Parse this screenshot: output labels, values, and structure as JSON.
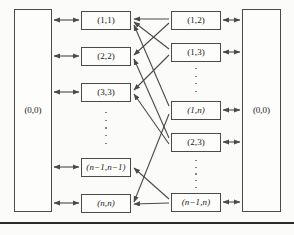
{
  "figure": {
    "background_color": "#fbfbfa",
    "line_color": "#4a4a4a",
    "text_color": "#1a1a1a",
    "bottom_rule_color": "#2b2b2b"
  },
  "left_panel": {
    "label": "(0,0)",
    "x": 14,
    "y": 9,
    "width": 38,
    "height": 203
  },
  "right_panel": {
    "label": "(0,0)",
    "x": 242,
    "y": 9,
    "width": 39,
    "height": 203
  },
  "left_column": {
    "nodes": [
      {
        "label": "(1,1)",
        "x": 81,
        "y": 11,
        "width": 50,
        "height": 19
      },
      {
        "label": "(2,2)",
        "x": 81,
        "y": 47,
        "width": 50,
        "height": 19
      },
      {
        "label": "(3,3)",
        "x": 81,
        "y": 83,
        "width": 50,
        "height": 19
      },
      {
        "label": "(n−1,n−1)",
        "x": 81,
        "y": 158,
        "width": 50,
        "height": 19
      },
      {
        "label": "(n,n)",
        "x": 81,
        "y": 194,
        "width": 50,
        "height": 19
      }
    ],
    "ellipsis": {
      "x": 106,
      "y": 112,
      "dots": 5
    }
  },
  "right_column": {
    "nodes": [
      {
        "label": "(1,2)",
        "x": 171,
        "y": 11,
        "width": 50,
        "height": 19
      },
      {
        "label": "(1,3)",
        "x": 171,
        "y": 43,
        "width": 50,
        "height": 19
      },
      {
        "label": "(1,n)",
        "x": 171,
        "y": 101,
        "width": 50,
        "height": 19
      },
      {
        "label": "(2,3)",
        "x": 171,
        "y": 133,
        "width": 50,
        "height": 19
      },
      {
        "label": "(n−1,n)",
        "x": 171,
        "y": 193,
        "width": 50,
        "height": 19
      }
    ],
    "ellipses": [
      {
        "x": 196,
        "y": 70,
        "dots": 4
      },
      {
        "x": 196,
        "y": 161,
        "dots": 5
      }
    ]
  },
  "connectors": {
    "left_panel_double_arrows": [
      {
        "from_x": 52,
        "to_x": 81,
        "y": 20
      },
      {
        "from_x": 52,
        "to_x": 81,
        "y": 56
      },
      {
        "from_x": 52,
        "to_x": 81,
        "y": 92
      },
      {
        "from_x": 52,
        "to_x": 81,
        "y": 167
      },
      {
        "from_x": 52,
        "to_x": 81,
        "y": 203
      }
    ],
    "right_panel_double_arrows": [
      {
        "from_x": 221,
        "to_x": 242,
        "y": 20
      },
      {
        "from_x": 221,
        "to_x": 242,
        "y": 52
      },
      {
        "from_x": 221,
        "to_x": 242,
        "y": 110
      },
      {
        "from_x": 221,
        "to_x": 242,
        "y": 142
      },
      {
        "from_x": 221,
        "to_x": 242,
        "y": 202
      }
    ],
    "cross_arrows": [
      {
        "from": "(1,2)",
        "to": "(1,1)",
        "x1": 171,
        "y1": 20,
        "x2": 133,
        "y2": 20
      },
      {
        "from": "(1,2)",
        "to": "(2,2)",
        "x1": 171,
        "y1": 22,
        "x2": 133,
        "y2": 56
      },
      {
        "from": "(1,3)",
        "to": "(1,1)",
        "x1": 171,
        "y1": 50,
        "x2": 133,
        "y2": 22
      },
      {
        "from": "(1,3)",
        "to": "(3,3)",
        "x1": 171,
        "y1": 54,
        "x2": 133,
        "y2": 90
      },
      {
        "from": "(1,n)",
        "to": "(1,1)",
        "x1": 171,
        "y1": 108,
        "x2": 133,
        "y2": 24
      },
      {
        "from": "(1,n)",
        "to": "(n,n)",
        "x1": 171,
        "y1": 112,
        "x2": 133,
        "y2": 203
      },
      {
        "from": "(2,3)",
        "to": "(2,2)",
        "x1": 171,
        "y1": 140,
        "x2": 133,
        "y2": 58
      },
      {
        "from": "(2,3)",
        "to": "(3,3)",
        "x1": 171,
        "y1": 143,
        "x2": 133,
        "y2": 92
      },
      {
        "from": "(n−1,n)",
        "to": "(n−1,n−1)",
        "x1": 171,
        "y1": 199,
        "x2": 133,
        "y2": 169
      },
      {
        "from": "(n−1,n)",
        "to": "(n,n)",
        "x1": 171,
        "y1": 203,
        "x2": 133,
        "y2": 205
      }
    ]
  },
  "bottom_rule": {
    "y": 222,
    "height": 2
  }
}
